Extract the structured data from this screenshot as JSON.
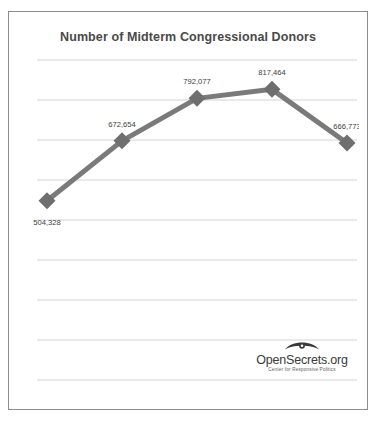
{
  "chart_data": {
    "type": "line",
    "title": "Number of Midterm Congressional Donors",
    "xlabel": "",
    "ylabel": "",
    "categories": [
      "1998",
      "2002",
      "2006",
      "2010",
      "2014"
    ],
    "values": [
      504328,
      672654,
      792077,
      817464,
      666773
    ],
    "point_labels": [
      "504,328",
      "672,654",
      "792,077",
      "817,464",
      "666,773"
    ],
    "series": [
      {
        "name": "Midterm Congressional Donors",
        "values": [
          504328,
          672654,
          792077,
          817464,
          666773
        ]
      }
    ],
    "xlim": [
      1998,
      2014
    ],
    "ylim": [
      0,
      900000
    ],
    "grid": true,
    "gridlines_count": 9,
    "legend": "none",
    "line_color": "#7a7a7a",
    "marker_color": "#6f6f6f",
    "marker_shape": "diamond",
    "axis_tick_labels": [
      "1998",
      "2002",
      "2006",
      "2010",
      "2014"
    ]
  },
  "logo": {
    "icon": "eye-icon",
    "wordmark": "OpenSecrets.org",
    "tagline": "Center for Responsive Politics"
  },
  "colors": {
    "border": "#8d8d8d",
    "grid": "#d4d4d4",
    "axis": "#a8a8a8",
    "title_text": "#4a4a4a",
    "label_text": "#3d3d3d"
  }
}
